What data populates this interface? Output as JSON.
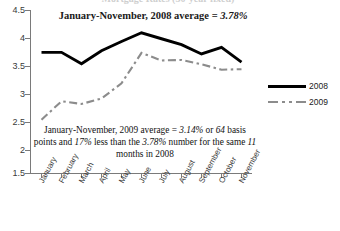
{
  "chart_data": {
    "type": "line",
    "title": "",
    "xlabel": "",
    "ylabel": "",
    "ylim": [
      1.5,
      4.5
    ],
    "ytick_step": 0.5,
    "ytick_labels": [
      "4.5",
      "4",
      "3.5",
      "3",
      "2.5",
      "2",
      "1.5"
    ],
    "ytick_values": [
      4.5,
      4,
      3.5,
      3,
      2.5,
      2,
      1.5
    ],
    "grid": false,
    "legend_position": "right",
    "categories": [
      "January",
      "February",
      "March",
      "April",
      "May",
      "June",
      "July",
      "August",
      "September",
      "October",
      "November"
    ],
    "series": [
      {
        "name": "2008",
        "style": "solid",
        "color": "#000000",
        "values": [
          3.73,
          3.73,
          3.52,
          3.76,
          3.93,
          4.09,
          3.98,
          3.87,
          3.7,
          3.82,
          3.55
        ]
      },
      {
        "name": "2009",
        "style": "dash-dot",
        "color": "#8c8c8c",
        "values": [
          2.49,
          2.83,
          2.78,
          2.88,
          3.16,
          3.72,
          3.58,
          3.59,
          3.51,
          3.41,
          3.42
        ]
      }
    ],
    "annotations": {
      "top": {
        "prefix": "January-November, 2008 average = ",
        "value": "3.78%"
      },
      "body": {
        "line1_pre": "January-November, 2009 average = ",
        "line1_val1": "3.14%",
        "line1_mid": " or ",
        "line1_val2": "64",
        "line2_pre": "basis points and ",
        "line2_val1": "17%",
        "line2_mid": " less than the ",
        "line2_val2": "3.78%",
        "line2_post": " number",
        "line3_pre": "for the same ",
        "line3_val1": "11",
        "line3_post": " months in 2008"
      }
    },
    "legend": [
      {
        "label": "2008"
      },
      {
        "label": "2009"
      }
    ]
  },
  "clipped_header": "Mortgage Rates (30-year fixed)"
}
